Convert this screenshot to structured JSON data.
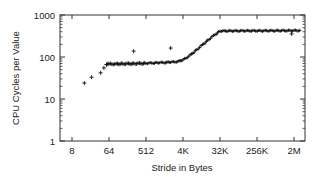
{
  "chart_data": {
    "type": "scatter",
    "title": "",
    "xlabel": "Stride in Bytes",
    "ylabel": "CPU Cycles per Value",
    "xscale": "log2",
    "yscale": "log10",
    "xlim": [
      5,
      4194304
    ],
    "ylim": [
      1,
      1000
    ],
    "xticks": [
      {
        "value": 8,
        "label": "8"
      },
      {
        "value": 64,
        "label": "64"
      },
      {
        "value": 512,
        "label": "512"
      },
      {
        "value": 4096,
        "label": "4K"
      },
      {
        "value": 32768,
        "label": "32K"
      },
      {
        "value": 262144,
        "label": "256K"
      },
      {
        "value": 2097152,
        "label": "2M"
      }
    ],
    "yticks": [
      {
        "value": 1,
        "label": "1"
      },
      {
        "value": 10,
        "label": "10"
      },
      {
        "value": 100,
        "label": "100"
      },
      {
        "value": 1000,
        "label": "1000"
      }
    ],
    "grid": false,
    "legend": null,
    "marker": "+",
    "series": [
      {
        "name": "measurements",
        "points": [
          [
            16,
            24
          ],
          [
            24,
            33
          ],
          [
            40,
            42
          ],
          [
            48,
            55
          ],
          [
            56,
            66
          ],
          [
            64,
            68
          ],
          [
            96,
            68
          ],
          [
            128,
            69
          ],
          [
            192,
            69
          ],
          [
            256,
            70
          ],
          [
            384,
            70
          ],
          [
            512,
            71
          ],
          [
            768,
            72
          ],
          [
            1024,
            73
          ],
          [
            1536,
            74
          ],
          [
            2048,
            75
          ],
          [
            3072,
            78
          ],
          [
            4096,
            85
          ],
          [
            6144,
            110
          ],
          [
            8192,
            140
          ],
          [
            12288,
            195
          ],
          [
            16384,
            250
          ],
          [
            24576,
            340
          ],
          [
            32768,
            415
          ],
          [
            65536,
            418
          ],
          [
            131072,
            420
          ],
          [
            262144,
            420
          ],
          [
            524288,
            422
          ],
          [
            1048576,
            424
          ],
          [
            2097152,
            425
          ],
          [
            3145728,
            428
          ]
        ]
      },
      {
        "name": "outliers",
        "points": [
          [
            256,
            138
          ],
          [
            2048,
            163
          ],
          [
            1835008,
            355
          ]
        ]
      }
    ]
  },
  "axes": {
    "xlabel": "Stride in Bytes",
    "ylabel": "CPU Cycles per Value"
  },
  "colors": {
    "axis": "#333333",
    "marker": "#111111",
    "text": "#222222"
  }
}
